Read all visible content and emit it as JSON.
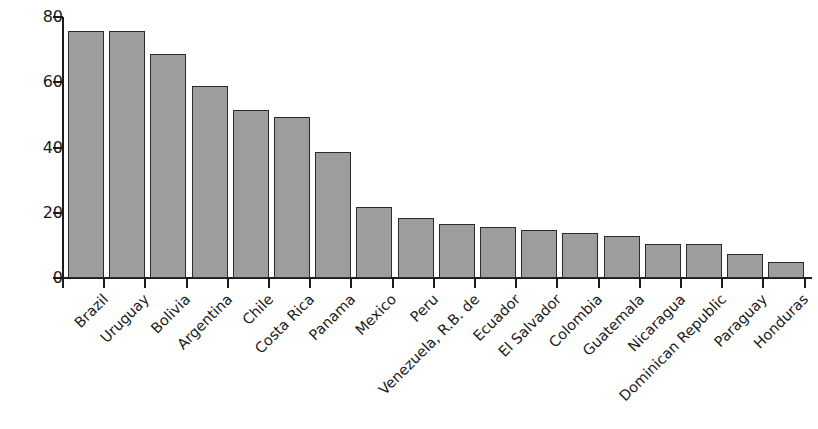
{
  "chart_data": {
    "type": "bar",
    "title": "",
    "subtitle": "",
    "xlabel": "",
    "ylabel": "percent",
    "ylim": [
      0,
      80
    ],
    "yticks": [
      0,
      20,
      40,
      60,
      80
    ],
    "grid": false,
    "legend": null,
    "bar_color": "#9d9d9d",
    "bar_edge_color": "#2b2b2b",
    "axis_color": "#1c1c1c",
    "label_rotation_degrees": 45,
    "categories": [
      "Brazil",
      "Uruguay",
      "Bolivia",
      "Argentina",
      "Chile",
      "Costa Rica",
      "Panama",
      "Mexico",
      "Peru",
      "Venezuela, R.B. de",
      "Ecuador",
      "El Salvador",
      "Colombia",
      "Guatemala",
      "Nicaragua",
      "Dominican Republic",
      "Paraguay",
      "Honduras"
    ],
    "values": [
      75.8,
      75.8,
      68.8,
      58.8,
      51.5,
      49.5,
      38.6,
      21.7,
      18.4,
      16.7,
      15.5,
      14.7,
      13.7,
      12.8,
      10.5,
      10.4,
      7.5,
      5.0
    ]
  }
}
